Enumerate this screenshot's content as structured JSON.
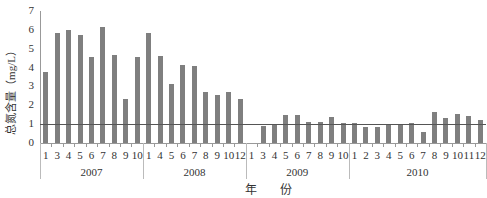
{
  "chart_data": {
    "type": "bar",
    "title": "",
    "xlabel": "年  份",
    "ylabel": "总氮含量（mg/L）",
    "ylim": [
      0,
      7
    ],
    "yticks": [
      0,
      1,
      2,
      3,
      4,
      5,
      6,
      7
    ],
    "grid": false,
    "reference_line": {
      "y": 1,
      "color": "#555555"
    },
    "bar_color": "#7f7f7f",
    "groups": [
      {
        "year": "2007",
        "months": [
          "1",
          "3",
          "4",
          "5",
          "6",
          "7",
          "8",
          "9",
          "10"
        ],
        "values": [
          3.77,
          5.84,
          5.98,
          5.71,
          4.57,
          6.15,
          4.69,
          2.33,
          4.57
        ]
      },
      {
        "year": "2008",
        "months": [
          "1",
          "4",
          "5",
          "6",
          "7",
          "8",
          "9",
          "10",
          "12"
        ],
        "values": [
          5.84,
          4.6,
          3.12,
          4.16,
          4.07,
          2.68,
          2.54,
          2.68,
          2.31
        ]
      },
      {
        "year": "2009",
        "months": [
          "1",
          "3",
          "4",
          "5",
          "6",
          "7",
          "8",
          "9",
          "10"
        ],
        "values": [
          null,
          0.9,
          0.95,
          1.47,
          1.47,
          1.11,
          1.11,
          1.36,
          1.04
        ]
      },
      {
        "year": "2010",
        "months": [
          "1",
          "2",
          "3",
          "4",
          "5",
          "6",
          "7",
          "8",
          "9",
          "10",
          "11",
          "12"
        ],
        "values": [
          1.04,
          0.86,
          0.86,
          0.95,
          0.97,
          1.04,
          0.58,
          1.62,
          1.32,
          1.53,
          1.44,
          1.22
        ]
      }
    ]
  }
}
